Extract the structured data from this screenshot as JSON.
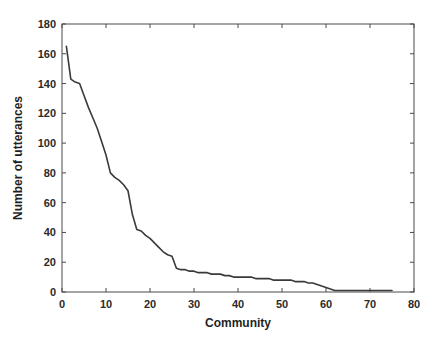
{
  "chart_data": {
    "type": "line",
    "title": "",
    "subtitle": "",
    "xlabel": "Community",
    "ylabel": "Number of utterances",
    "xlim": [
      0,
      80
    ],
    "ylim": [
      0,
      180
    ],
    "xticks": [
      0,
      10,
      20,
      30,
      40,
      50,
      60,
      70,
      80
    ],
    "yticks": [
      0,
      20,
      40,
      60,
      80,
      100,
      120,
      140,
      160,
      180
    ],
    "xtick_labels": [
      "0",
      "10",
      "20",
      "30",
      "40",
      "50",
      "60",
      "70",
      "80"
    ],
    "ytick_labels": [
      "0",
      "20",
      "40",
      "60",
      "80",
      "100",
      "120",
      "140",
      "160",
      "180"
    ],
    "grid": false,
    "legend": null,
    "legend_position": "none",
    "annotations": [],
    "series": [
      {
        "name": "utterances-per-community",
        "color": "#3a3a3a",
        "line_width": 1.6,
        "marker": "none",
        "x": [
          1,
          2,
          3,
          4,
          5,
          6,
          7,
          8,
          9,
          10,
          11,
          12,
          13,
          14,
          15,
          16,
          17,
          18,
          19,
          20,
          21,
          22,
          23,
          24,
          25,
          26,
          27,
          28,
          29,
          30,
          31,
          32,
          33,
          34,
          35,
          36,
          37,
          38,
          39,
          40,
          41,
          42,
          43,
          44,
          45,
          46,
          47,
          48,
          49,
          50,
          51,
          52,
          53,
          54,
          55,
          56,
          57,
          58,
          59,
          60,
          61,
          62,
          63,
          64,
          65,
          66,
          67,
          68,
          69,
          70,
          71,
          72,
          73,
          74,
          75
        ],
        "values": [
          165,
          143,
          141,
          140,
          132,
          124,
          117,
          110,
          101,
          92,
          80,
          77,
          75,
          72,
          68,
          52,
          42,
          41,
          38,
          36,
          33,
          30,
          27,
          25,
          24,
          16,
          15,
          15,
          14,
          14,
          13,
          13,
          13,
          12,
          12,
          12,
          11,
          11,
          10,
          10,
          10,
          10,
          10,
          9,
          9,
          9,
          9,
          8,
          8,
          8,
          8,
          8,
          7,
          7,
          7,
          6,
          6,
          5,
          4,
          3,
          2,
          1,
          1,
          1,
          1,
          1,
          1,
          1,
          1,
          1,
          1,
          1,
          1,
          1,
          1
        ]
      }
    ]
  },
  "axes": {
    "xlabel": "Community",
    "ylabel": "Number of utterances"
  }
}
